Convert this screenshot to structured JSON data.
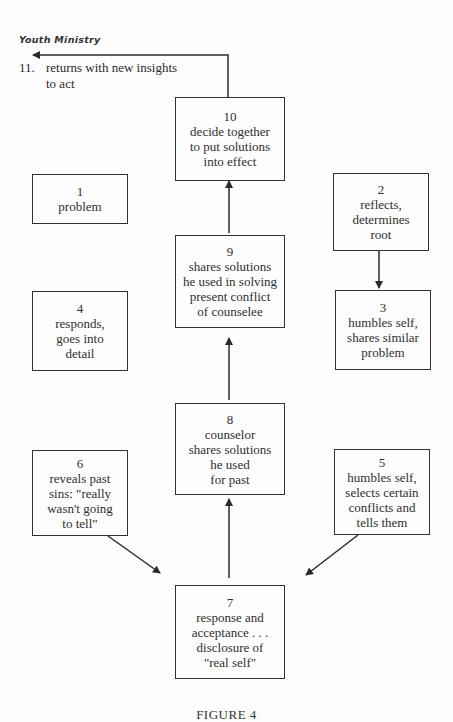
{
  "header": {
    "title": "Youth Ministry"
  },
  "step11": {
    "number": "11.",
    "line1": "returns with new insights",
    "line2": "to act"
  },
  "boxes": {
    "b1": {
      "number": "1",
      "lines": [
        "problem"
      ]
    },
    "b2": {
      "number": "2",
      "lines": [
        "reflects,",
        "determines",
        "root"
      ]
    },
    "b3": {
      "number": "3",
      "lines": [
        "humbles self,",
        "shares similar",
        "problem"
      ]
    },
    "b4": {
      "number": "4",
      "lines": [
        "responds,",
        "goes into",
        "detail"
      ]
    },
    "b5": {
      "number": "5",
      "lines": [
        "humbles self,",
        "selects certain",
        "conflicts and",
        "tells them"
      ]
    },
    "b6": {
      "number": "6",
      "lines": [
        "reveals past",
        "sins: \"really",
        "wasn't going",
        "to tell\""
      ]
    },
    "b7": {
      "number": "7",
      "lines": [
        "response and",
        "acceptance . . .",
        "disclosure of",
        "\"real self\""
      ]
    },
    "b8": {
      "number": "8",
      "lines": [
        "counselor",
        "shares solutions",
        "he used",
        "for past"
      ]
    },
    "b9": {
      "number": "9",
      "lines": [
        "shares solutions",
        "he used in solving",
        "present conflict",
        "of counselee"
      ]
    },
    "b10": {
      "number": "10",
      "lines": [
        "decide together",
        "to put solutions",
        "into effect"
      ]
    }
  },
  "caption": "FIGURE 4"
}
